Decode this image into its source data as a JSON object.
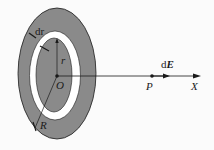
{
  "diagram": {
    "labels": {
      "ring_width": "dr",
      "inner_radius": "r",
      "outer_radius": "R",
      "origin": "O",
      "point": "P",
      "field_element_prefix": "d",
      "field_element_vector": "E",
      "axis": "X"
    },
    "colors": {
      "disk_fill": "#8a8a8a",
      "ring_fill": "#ffffff",
      "stroke": "#1a1a1a",
      "background": "#fbfbfb"
    }
  }
}
